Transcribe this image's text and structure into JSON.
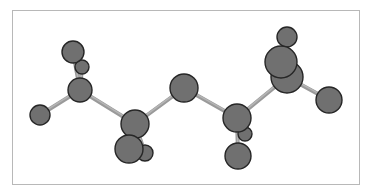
{
  "diagram": {
    "type": "ball-and-stick molecular model",
    "colors": {
      "atom_fill": "#707070",
      "atom_outline": "#262626",
      "bond": "#9a9a9a",
      "frame_border": "#b8b8b8",
      "background": "#ffffff"
    },
    "atoms": [
      {
        "id": "h-top-left-back",
        "element": "H"
      },
      {
        "id": "h-top-left-front",
        "element": "H"
      },
      {
        "id": "c1",
        "element": "C"
      },
      {
        "id": "h-left",
        "element": "H"
      },
      {
        "id": "c2",
        "element": "C"
      },
      {
        "id": "h-c2-small",
        "element": "H"
      },
      {
        "id": "h-c2-large",
        "element": "H"
      },
      {
        "id": "o",
        "element": "O"
      },
      {
        "id": "c3",
        "element": "C"
      },
      {
        "id": "h-c3-small",
        "element": "H"
      },
      {
        "id": "h-c3-bottom",
        "element": "H"
      },
      {
        "id": "c4",
        "element": "C"
      },
      {
        "id": "h-top-right",
        "element": "H"
      },
      {
        "id": "h-c4-front",
        "element": "H"
      },
      {
        "id": "h-right",
        "element": "H"
      }
    ],
    "bonds": [
      [
        "h-left",
        "c1"
      ],
      [
        "c1",
        "h-top-left-back"
      ],
      [
        "c1",
        "h-top-left-front"
      ],
      [
        "c1",
        "c2"
      ],
      [
        "c2",
        "o"
      ],
      [
        "c2",
        "h-c2-large"
      ],
      [
        "c2",
        "h-c2-small"
      ],
      [
        "o",
        "c3"
      ],
      [
        "c3",
        "c4"
      ],
      [
        "c3",
        "h-c3-small"
      ],
      [
        "c3",
        "h-c3-bottom"
      ],
      [
        "c4",
        "h-right"
      ],
      [
        "c4",
        "h-top-right"
      ],
      [
        "c4",
        "h-c4-front"
      ]
    ]
  }
}
